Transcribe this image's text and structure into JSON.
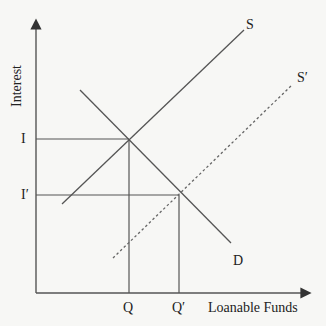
{
  "diagram": {
    "type": "supply-demand",
    "axes": {
      "x_label": "Loanable Funds",
      "y_label": "Interest"
    },
    "curves": {
      "supply": {
        "label": "S",
        "style": "solid"
      },
      "supply_shifted": {
        "label": "S′",
        "style": "dashed"
      },
      "demand": {
        "label": "D",
        "style": "solid"
      }
    },
    "tick_labels": {
      "interest_original": "I",
      "interest_new": "I′",
      "quantity_original": "Q",
      "quantity_new": "Q′"
    },
    "colors": {
      "line": "#555555",
      "text": "#222222",
      "background": "#f7f7f5"
    }
  }
}
